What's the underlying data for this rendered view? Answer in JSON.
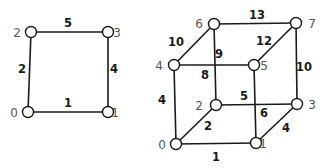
{
  "diagram": {
    "colors": {
      "edge": "#1a1a1a",
      "node_fill": "#ffffff",
      "node_label": "#555555",
      "weight_label": "#1a1a1a"
    },
    "graphs": [
      {
        "name": "square",
        "nodes": [
          {
            "id": "0",
            "label": "0",
            "x": 28,
            "y": 112,
            "lx": 14,
            "ly": 117
          },
          {
            "id": "1",
            "label": "1",
            "x": 108,
            "y": 112,
            "lx": 115,
            "ly": 117
          },
          {
            "id": "2",
            "label": "2",
            "x": 31,
            "y": 32,
            "lx": 17,
            "ly": 37
          },
          {
            "id": "3",
            "label": "3",
            "x": 108,
            "y": 32,
            "lx": 117,
            "ly": 37
          }
        ],
        "edges": [
          {
            "from": "0",
            "to": "1",
            "weight": "1",
            "wx": 68,
            "wy": 107
          },
          {
            "from": "0",
            "to": "2",
            "weight": "2",
            "wx": 22,
            "wy": 73
          },
          {
            "from": "2",
            "to": "3",
            "weight": "5",
            "wx": 68,
            "wy": 27
          },
          {
            "from": "1",
            "to": "3",
            "weight": "4",
            "wx": 114,
            "wy": 73
          }
        ]
      },
      {
        "name": "cube",
        "nodes": [
          {
            "id": "0",
            "label": "0",
            "x": 176,
            "y": 144,
            "lx": 162,
            "ly": 149
          },
          {
            "id": "1",
            "label": "1",
            "x": 256,
            "y": 143,
            "lx": 263,
            "ly": 148
          },
          {
            "id": "2",
            "label": "2",
            "x": 216,
            "y": 105,
            "lx": 199,
            "ly": 110
          },
          {
            "id": "3",
            "label": "3",
            "x": 297,
            "y": 104,
            "lx": 312,
            "ly": 109
          },
          {
            "id": "4",
            "label": "4",
            "x": 174,
            "y": 65,
            "lx": 159,
            "ly": 70
          },
          {
            "id": "5",
            "label": "5",
            "x": 254,
            "y": 65,
            "lx": 264,
            "ly": 70
          },
          {
            "id": "6",
            "label": "6",
            "x": 214,
            "y": 24,
            "lx": 199,
            "ly": 28
          },
          {
            "id": "7",
            "label": "7",
            "x": 296,
            "y": 23,
            "lx": 312,
            "ly": 28
          }
        ],
        "edges": [
          {
            "from": "0",
            "to": "1",
            "weight": "1",
            "wx": 216,
            "wy": 161
          },
          {
            "from": "0",
            "to": "2",
            "weight": "2",
            "wx": 208,
            "wy": 130
          },
          {
            "from": "0",
            "to": "4",
            "weight": "4",
            "wx": 162,
            "wy": 104
          },
          {
            "from": "1",
            "to": "3",
            "weight": "4",
            "wx": 286,
            "wy": 132
          },
          {
            "from": "1",
            "to": "5",
            "weight": "6",
            "wx": 264,
            "wy": 117
          },
          {
            "from": "2",
            "to": "3",
            "weight": "5",
            "wx": 244,
            "wy": 100
          },
          {
            "from": "2",
            "to": "6",
            "weight": "8",
            "wx": 205,
            "wy": 79
          },
          {
            "from": "4",
            "to": "5",
            "weight": "9",
            "wx": 219,
            "wy": 58
          },
          {
            "from": "4",
            "to": "6",
            "weight": "10",
            "wx": 176,
            "wy": 46
          },
          {
            "from": "3",
            "to": "7",
            "weight": "10",
            "wx": 304,
            "wy": 71
          },
          {
            "from": "5",
            "to": "7",
            "weight": "12",
            "wx": 264,
            "wy": 45
          },
          {
            "from": "6",
            "to": "7",
            "weight": "13",
            "wx": 257,
            "wy": 19
          }
        ]
      }
    ]
  }
}
